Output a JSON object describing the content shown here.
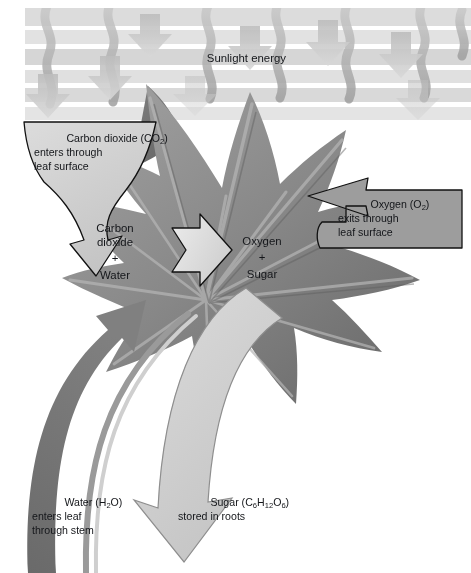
{
  "figure": {
    "title_text": "Sunlight energy",
    "type": "photosynthesis-diagram",
    "background_color": "#ffffff",
    "leaf_color": "#8a8a8a",
    "leaf_dark_color": "#6d6d6d",
    "band_color": "#d7d7d7",
    "callout_light_color": "#d2d2d2",
    "callout_dark_color": "#9a9a9a",
    "water_arrow_color": "#6f6f6f",
    "sugar_arrow_color": "#d0d0d0",
    "reaction_arrow_color": "#dcdcdc",
    "outline_color": "#111111"
  },
  "sunlight": {
    "label": "Sunlight energy",
    "wavy_arrow_count": 7,
    "straight_arrow_count": 6
  },
  "callouts": {
    "carbon_dioxide": {
      "line1": "Carbon dioxide (CO",
      "sub1": "2",
      "line1_tail": ")",
      "line2": "enters through",
      "line3": "leaf surface",
      "full_text": "Carbon dioxide (CO2) enters through leaf surface",
      "fill": "#d2d2d2"
    },
    "oxygen": {
      "line1": "Oxygen (O",
      "sub1": "2",
      "line1_tail": ")",
      "line2": "exits through",
      "line3": "leaf surface",
      "full_text": "Oxygen (O2) exits through leaf surface",
      "fill": "#9a9a9a"
    }
  },
  "equation": {
    "left": {
      "line1": "Carbon",
      "line2": "dioxide",
      "plus": "+",
      "line3": "Water",
      "full_text": "Carbon dioxide + Water"
    },
    "arrow": "reaction-arrow-right",
    "right": {
      "line1": "Oxygen",
      "plus": "+",
      "line2": "Sugar",
      "full_text": "Oxygen + Sugar"
    }
  },
  "bottom_labels": {
    "water": {
      "line1": "Water (H",
      "sub1": "2",
      "line1_tail": "O)",
      "line2": "enters leaf",
      "line3": "through stem",
      "full_text": "Water (H2O) enters leaf through stem"
    },
    "sugar": {
      "line1_a": "Sugar (C",
      "sub_a": "6",
      "line1_b": "H",
      "sub_b": "12",
      "line1_c": "O",
      "sub_c": "6",
      "line1_d": ")",
      "line2": "stored in roots",
      "full_text": "Sugar (C6H12O6) stored in roots"
    }
  }
}
